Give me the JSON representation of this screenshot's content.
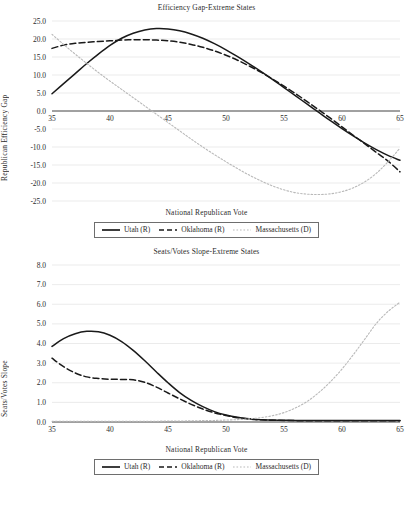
{
  "figure": {
    "axis_color": "#3a3a3a",
    "grid_color": "#e2e2e2",
    "series_colors": {
      "utah": "#1a1a1a",
      "oklahoma": "#1a1a1a",
      "massachusetts": "#b9b9b9"
    }
  },
  "chart_data": [
    {
      "type": "line",
      "title": "Efficiency Gap-Extreme States",
      "xlabel": "National Republican Vote",
      "ylabel": "Republican Efficiency Gap",
      "xlim": [
        35,
        65
      ],
      "ylim": [
        -25,
        25
      ],
      "xticks": [
        35,
        40,
        45,
        50,
        55,
        60,
        65
      ],
      "yticks": [
        25.0,
        20.0,
        15.0,
        10.0,
        5.0,
        0.0,
        -5.0,
        -10.0,
        -15.0,
        -20.0,
        -25.0
      ],
      "ytick_labels": [
        "25.0",
        "20.0",
        "15.0",
        "10.0",
        "5.0",
        "0.0",
        "-5.0",
        "-10.0",
        "-15.0",
        "-20.0",
        "-25.0"
      ],
      "xtick_labels": [
        "35",
        "40",
        "45",
        "50",
        "55",
        "60",
        "65"
      ],
      "grid": true,
      "legend_position": "below",
      "x": [
        35,
        36,
        37,
        38,
        39,
        40,
        41,
        42,
        43,
        44,
        45,
        46,
        47,
        48,
        49,
        50,
        51,
        52,
        53,
        54,
        55,
        56,
        57,
        58,
        59,
        60,
        61,
        62,
        63,
        64,
        65
      ],
      "series": [
        {
          "name": "Utah (R)",
          "style": "solid",
          "values": [
            4.8,
            7.6,
            10.4,
            13.2,
            15.8,
            18.2,
            20.2,
            21.6,
            22.5,
            22.9,
            22.8,
            22.3,
            21.4,
            20.2,
            18.7,
            17.0,
            15.1,
            13.1,
            11.0,
            8.8,
            6.5,
            4.2,
            1.9,
            -0.4,
            -2.7,
            -4.9,
            -7.0,
            -9.0,
            -10.8,
            -12.4,
            -13.7
          ]
        },
        {
          "name": "Oklahoma (R)",
          "style": "dashed",
          "values": [
            17.4,
            18.3,
            18.8,
            19.1,
            19.3,
            19.5,
            19.7,
            19.8,
            19.8,
            19.7,
            19.5,
            19.1,
            18.5,
            17.7,
            16.7,
            15.5,
            14.1,
            12.5,
            10.8,
            8.9,
            6.9,
            4.8,
            2.6,
            0.3,
            -2.0,
            -4.4,
            -6.8,
            -9.2,
            -11.6,
            -14.0,
            -16.9
          ]
        },
        {
          "name": "Massachusetts (D)",
          "style": "dotted",
          "values": [
            21.3,
            18.5,
            15.8,
            13.2,
            10.7,
            8.3,
            6.0,
            3.7,
            1.4,
            -0.9,
            -3.2,
            -5.5,
            -7.8,
            -10.0,
            -12.1,
            -14.1,
            -16.0,
            -17.8,
            -19.4,
            -20.8,
            -21.9,
            -22.7,
            -23.1,
            -23.2,
            -23.0,
            -22.4,
            -21.3,
            -19.6,
            -17.2,
            -14.0,
            -10.3
          ]
        }
      ]
    },
    {
      "type": "line",
      "title": "Seats/Votes Slope-Extreme States",
      "xlabel": "National Republican Vote",
      "ylabel": "Seats/Votes Slope",
      "xlim": [
        35,
        65
      ],
      "ylim": [
        0,
        8
      ],
      "xticks": [
        35,
        40,
        45,
        50,
        55,
        60,
        65
      ],
      "yticks": [
        8.0,
        7.0,
        6.0,
        5.0,
        4.0,
        3.0,
        2.0,
        1.0,
        0.0
      ],
      "ytick_labels": [
        "8.0",
        "7.0",
        "6.0",
        "5.0",
        "4.0",
        "3.0",
        "2.0",
        "1.0",
        "0.0"
      ],
      "xtick_labels": [
        "35",
        "40",
        "45",
        "50",
        "55",
        "60",
        "65"
      ],
      "grid": true,
      "legend_position": "below",
      "x": [
        35,
        36,
        37,
        38,
        39,
        40,
        41,
        42,
        43,
        44,
        45,
        46,
        47,
        48,
        49,
        50,
        51,
        52,
        53,
        54,
        55,
        56,
        57,
        58,
        59,
        60,
        61,
        62,
        63,
        64,
        65
      ],
      "series": [
        {
          "name": "Utah (R)",
          "style": "solid",
          "values": [
            3.85,
            4.25,
            4.5,
            4.62,
            4.6,
            4.42,
            4.1,
            3.65,
            3.12,
            2.55,
            2.0,
            1.5,
            1.1,
            0.78,
            0.53,
            0.36,
            0.24,
            0.16,
            0.12,
            0.1,
            0.09,
            0.08,
            0.08,
            0.08,
            0.08,
            0.08,
            0.08,
            0.08,
            0.08,
            0.08,
            0.08
          ]
        },
        {
          "name": "Oklahoma (R)",
          "style": "dashed",
          "values": [
            3.25,
            2.82,
            2.5,
            2.3,
            2.22,
            2.18,
            2.17,
            2.15,
            2.02,
            1.78,
            1.48,
            1.18,
            0.9,
            0.66,
            0.47,
            0.33,
            0.22,
            0.15,
            0.11,
            0.09,
            0.08,
            0.07,
            0.07,
            0.07,
            0.07,
            0.07,
            0.07,
            0.07,
            0.07,
            0.07,
            0.07
          ]
        },
        {
          "name": "Massachusetts (D)",
          "style": "dotted",
          "values": [
            0.04,
            0.04,
            0.04,
            0.04,
            0.04,
            0.04,
            0.04,
            0.04,
            0.04,
            0.04,
            0.05,
            0.05,
            0.06,
            0.07,
            0.08,
            0.1,
            0.12,
            0.16,
            0.22,
            0.32,
            0.48,
            0.72,
            1.05,
            1.5,
            2.05,
            2.7,
            3.45,
            4.25,
            5.05,
            5.65,
            6.1
          ]
        }
      ]
    }
  ]
}
